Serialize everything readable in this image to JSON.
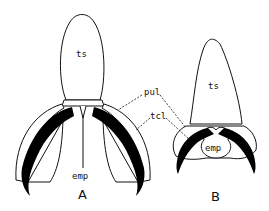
{
  "figure": {
    "panel_a": {
      "label": "A",
      "parts": {
        "tarsus": "ts",
        "empodium": "emp"
      }
    },
    "panel_b": {
      "label": "B",
      "parts": {
        "tarsus": "ts",
        "empodium": "emp"
      }
    },
    "shared_labels": {
      "pulvillus": "pul",
      "tarsal_claw": "tcl"
    },
    "colors": {
      "line": "#111111",
      "fill_claw": "#000000",
      "background": "#ffffff"
    }
  }
}
